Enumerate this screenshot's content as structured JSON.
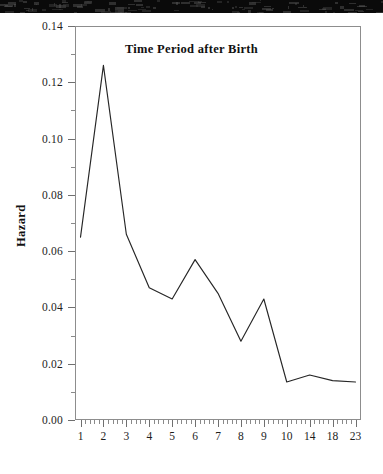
{
  "figure": {
    "background_color": "#ffffff",
    "frame_color": "#8d8d8d",
    "line_color": "#262626",
    "scan_bar_color": "#0a0a0a"
  },
  "chart_data": {
    "type": "line",
    "title": "",
    "xlabel": "Time Period after Birth",
    "ylabel": "Hazard",
    "categories": [
      "1",
      "2",
      "3",
      "4",
      "5",
      "6",
      "7",
      "8",
      "9",
      "10",
      "14",
      "18",
      "23"
    ],
    "values": [
      0.065,
      0.126,
      0.066,
      0.047,
      0.043,
      0.057,
      0.045,
      0.028,
      0.043,
      0.0135,
      0.016,
      0.014,
      0.0135
    ],
    "series": [
      {
        "name": "Hazard",
        "values": [
          0.065,
          0.126,
          0.066,
          0.047,
          0.043,
          0.057,
          0.045,
          0.028,
          0.043,
          0.0135,
          0.016,
          0.014,
          0.0135
        ]
      }
    ],
    "ylim": [
      0.0,
      0.14
    ],
    "xlim": [
      0,
      14
    ],
    "ytick_labels": [
      "0.00",
      "0.02",
      "0.04",
      "0.06",
      "0.08",
      "0.10",
      "0.12",
      "0.14"
    ],
    "ytick_values": [
      0.0,
      0.02,
      0.04,
      0.06,
      0.08,
      0.1,
      0.12,
      0.14
    ],
    "yminor_interval": 0.01,
    "xtick_labels": [
      "1",
      "2",
      "3",
      "4",
      "5",
      "6",
      "7",
      "8",
      "9",
      "10",
      "14",
      "18",
      "23"
    ],
    "xminor_per_major": 5,
    "grid": false,
    "legend": false,
    "legend_position": "none",
    "markers": false,
    "line_width": 1
  }
}
